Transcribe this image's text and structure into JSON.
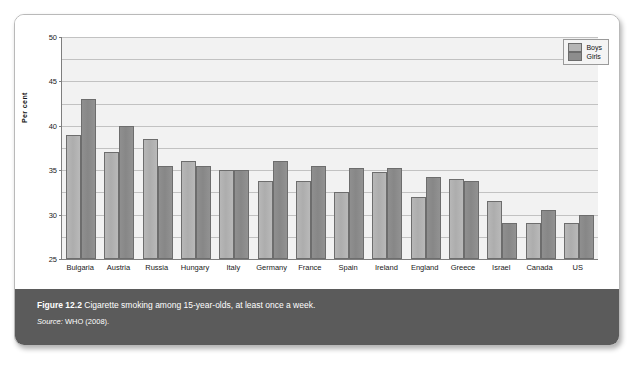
{
  "figure": {
    "number_label": "Figure 12.2",
    "caption": "Cigarette smoking among 15-year-olds, at least once a week.",
    "source_label": "Source:",
    "source_text": "WHO (2008)."
  },
  "legend": {
    "position": "top-right",
    "entries": [
      {
        "name": "Boys",
        "color": "#b5b5b5"
      },
      {
        "name": "Girls",
        "color": "#8d8d8d"
      }
    ]
  },
  "chart_data": {
    "type": "bar",
    "title": "",
    "xlabel": "",
    "ylabel": "Per cent",
    "ylim": [
      0,
      50
    ],
    "yticks": [
      0,
      5,
      10,
      15,
      20,
      25,
      30,
      35,
      40,
      45,
      50
    ],
    "ytick_labels": [
      "0",
      "5",
      "10",
      "15",
      "20",
      "25",
      "30",
      "35",
      "40",
      "45",
      "50"
    ],
    "grid": true,
    "legend_position": "upper right",
    "categories": [
      "Bulgaria",
      "Austria",
      "Russia",
      "Hungary",
      "Italy",
      "Germany",
      "France",
      "Spain",
      "Ireland",
      "England",
      "Greece",
      "Israel",
      "Canada",
      "US"
    ],
    "series": [
      {
        "name": "Boys",
        "color": "#b5b5b5",
        "values": [
          28,
          24,
          27,
          22,
          20,
          17.5,
          17.5,
          15,
          19.5,
          14,
          18,
          13,
          8,
          8
        ]
      },
      {
        "name": "Girls",
        "color": "#8d8d8d",
        "values": [
          36,
          30,
          21,
          21,
          20,
          22,
          21,
          20.5,
          20.5,
          18.5,
          17.5,
          8,
          11,
          10
        ]
      }
    ]
  }
}
